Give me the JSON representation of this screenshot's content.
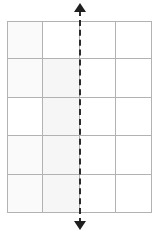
{
  "figure": {
    "title": "",
    "labels": []
  },
  "chart_data": {
    "type": "table",
    "title": "",
    "xlabel": "",
    "ylabel": "",
    "columns": 4,
    "rows": 5,
    "grid": true,
    "grid_line_color": "#b2b2b2",
    "cell_background": "#ffffff",
    "cells": [
      [
        {
          "shade": "shade-a",
          "value": ""
        },
        {
          "shade": "shade-c",
          "value": ""
        },
        {
          "shade": "shade-c",
          "value": ""
        },
        {
          "shade": "shade-c",
          "value": ""
        }
      ],
      [
        {
          "shade": "shade-a",
          "value": ""
        },
        {
          "shade": "shade-b",
          "value": ""
        },
        {
          "shade": "shade-c",
          "value": ""
        },
        {
          "shade": "shade-c",
          "value": ""
        }
      ],
      [
        {
          "shade": "shade-c",
          "value": ""
        },
        {
          "shade": "shade-b",
          "value": ""
        },
        {
          "shade": "shade-c",
          "value": ""
        },
        {
          "shade": "shade-c",
          "value": ""
        }
      ],
      [
        {
          "shade": "shade-a",
          "value": ""
        },
        {
          "shade": "shade-b",
          "value": ""
        },
        {
          "shade": "shade-c",
          "value": ""
        },
        {
          "shade": "shade-c",
          "value": ""
        }
      ],
      [
        {
          "shade": "shade-a",
          "value": ""
        },
        {
          "shade": "shade-b",
          "value": ""
        },
        {
          "shade": "shade-c",
          "value": ""
        },
        {
          "shade": "shade-c",
          "value": ""
        }
      ]
    ],
    "annotations": [
      {
        "name": "symmetry-axis",
        "orientation": "vertical",
        "style": "dashed",
        "color": "#2b2b2b",
        "arrow_start": "up",
        "arrow_end": "down",
        "x_position_columns": 2,
        "label": ""
      }
    ]
  }
}
